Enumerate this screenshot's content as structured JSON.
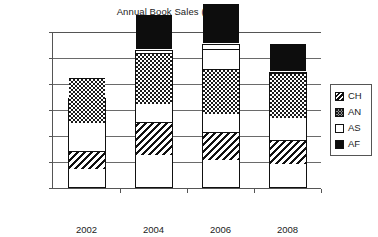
{
  "chart_data": {
    "type": "bar",
    "subtype": "stacked-bar",
    "title": "Annual Book Sales (£)",
    "xlabel": "",
    "ylabel": "Tens of thousands £",
    "categories": [
      "2002",
      "2004",
      "2006",
      "2008"
    ],
    "ylim": [
      0,
      60
    ],
    "yticks": [
      0,
      10,
      20,
      30,
      40,
      50,
      60
    ],
    "ytick_labels": [
      "0",
      "10",
      "20",
      "30",
      "40",
      "50",
      "60"
    ],
    "grid": true,
    "grid_axis": "y",
    "legend_position": "right",
    "series": [
      {
        "name": "AF",
        "pattern": "solid-black",
        "color": "#0d0d0d",
        "values": [
          6.2,
          13.0,
          15.0,
          10.7
        ]
      },
      {
        "name": "AS",
        "pattern": "empty-white",
        "color": "#ffffff",
        "values": [
          3.8,
          8.0,
          12.5,
          7.3
        ]
      },
      {
        "name": "AN",
        "pattern": "dotted-speckle",
        "color": "#ffffff",
        "values": [
          17.5,
          19.5,
          17.5,
          17.5
        ]
      },
      {
        "name": "CH",
        "pattern": "diagonal-hatch",
        "color": "#ffffff",
        "values": [
          7.0,
          12.5,
          10.5,
          9.0
        ]
      }
    ],
    "stack_tops": {
      "2002": {
        "AF": 6.2,
        "AS": 10.0,
        "AN": 27.5,
        "CH": 34.5
      },
      "2004": {
        "AF": 13.0,
        "AS": 21.0,
        "AN": 40.5,
        "CH": 53.0
      },
      "2006": {
        "AF": 15.0,
        "AS": 27.5,
        "AN": 45.0,
        "CH": 55.5
      },
      "2008": {
        "AF": 10.7,
        "AS": 18.0,
        "AN": 35.5,
        "CH": 44.5
      }
    },
    "totals": [
      34.5,
      53.0,
      55.5,
      44.5
    ]
  },
  "legend": {
    "entries": [
      {
        "label": "CH",
        "swatch": "swatch-ch-hatch"
      },
      {
        "label": "AN",
        "swatch": "swatch-an-dots"
      },
      {
        "label": "AS",
        "swatch": "swatch-as-white"
      },
      {
        "label": "AF",
        "swatch": "swatch-af-black"
      }
    ]
  },
  "colors": {
    "axis": "#555555",
    "gridline": "#6a6a6a",
    "ink": "#111111",
    "background": "#ffffff"
  }
}
